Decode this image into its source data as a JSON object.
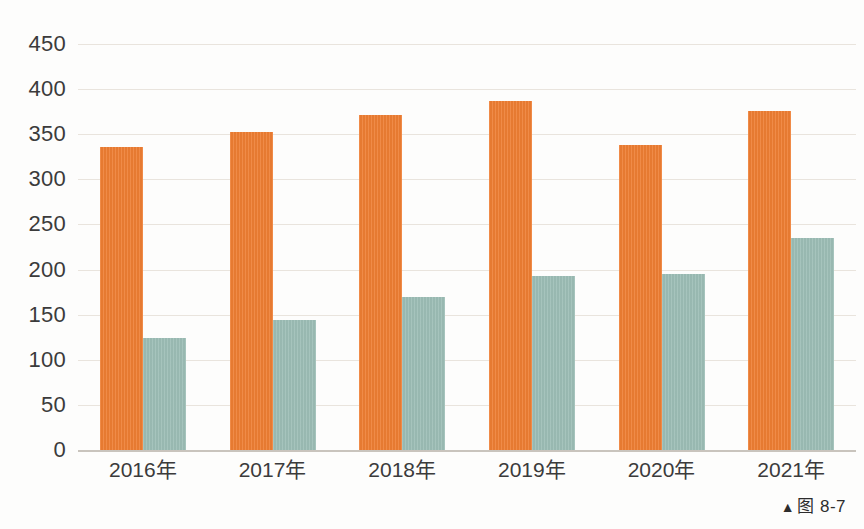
{
  "chart_data": {
    "type": "bar",
    "title": "",
    "subtitle": "",
    "xlabel": "",
    "ylabel": "",
    "categories": [
      "2016年",
      "2017年",
      "2018年",
      "2019年",
      "2020年",
      "2021年"
    ],
    "series": [
      {
        "name": "series-1",
        "color": "#ee7e33",
        "values": [
          336,
          353,
          371,
          387,
          338,
          376
        ]
      },
      {
        "name": "series-2",
        "color": "#9dbeb6",
        "values": [
          124,
          144,
          170,
          193,
          195,
          235
        ]
      }
    ],
    "ylim": [
      0,
      450
    ],
    "ytick_values": [
      0,
      50,
      100,
      150,
      200,
      250,
      300,
      350,
      400,
      450
    ],
    "ytick_labels": [
      "0",
      "50",
      "100",
      "150",
      "200",
      "250",
      "300",
      "350",
      "400",
      "450"
    ],
    "grid": true,
    "legend": "none",
    "legend_position": "none",
    "annotations": []
  },
  "caption": {
    "marker": "▲",
    "text": "图 8-7"
  },
  "colors": {
    "series_1": "#ee7e33",
    "series_2": "#9dbeb6",
    "grid": "#e9e4dd",
    "axis": "#c9c4bd",
    "text": "#3b3b3b",
    "background": "#fdfdfc"
  }
}
